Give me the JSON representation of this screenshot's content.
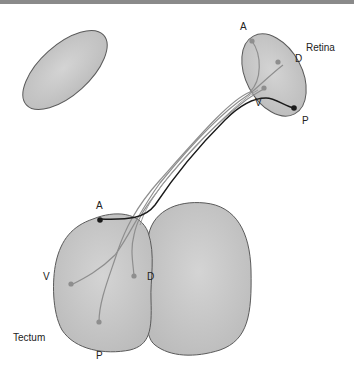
{
  "figure": {
    "type": "retinotectal projection diagram",
    "labels": {
      "retina": "Retina",
      "tectum": "Tectum",
      "retina_axes": {
        "anterior": "A",
        "dorsal": "D",
        "ventral": "V",
        "posterior": "P"
      },
      "tectum_axes": {
        "anterior": "A",
        "dorsal": "D",
        "ventral": "V",
        "posterior": "P"
      }
    },
    "colors": {
      "fill": "#c8c8c8",
      "outline": "#5a5a5a",
      "axon_gray": "#8e8e8e",
      "axon_dark": "#1a1a1a",
      "top_bar": "#8a8a8a"
    },
    "mapping": [
      {
        "retina": "A",
        "tectum": "P",
        "shade": "gray"
      },
      {
        "retina": "D",
        "tectum": "V",
        "shade": "gray"
      },
      {
        "retina": "V",
        "tectum": "D",
        "shade": "gray"
      },
      {
        "retina": "P",
        "tectum": "A",
        "shade": "dark"
      }
    ]
  }
}
